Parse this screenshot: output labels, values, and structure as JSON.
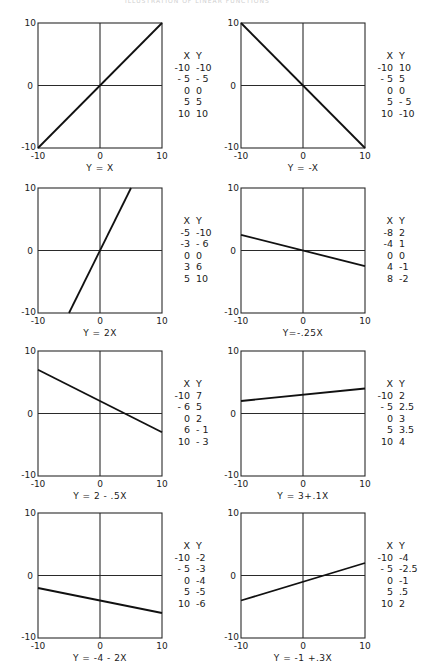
{
  "page": {
    "header_left": "",
    "header_center": "ILLUSTRATION OF LINEAR FUNCTIONS",
    "header_right": ""
  },
  "axis": {
    "min_label": "-10",
    "zero_label": "0",
    "max_label": "10"
  },
  "table_headers": {
    "x": "X",
    "y": "Y"
  },
  "panels": [
    {
      "equation": "Y = X",
      "rows": [
        [
          "-10",
          "-10"
        ],
        [
          "- 5",
          "- 5"
        ],
        [
          "0",
          "0"
        ],
        [
          "5",
          "5"
        ],
        [
          "10",
          "10"
        ]
      ]
    },
    {
      "equation": "Y = -X",
      "rows": [
        [
          "-10",
          "10"
        ],
        [
          "- 5",
          "5"
        ],
        [
          "0",
          "0"
        ],
        [
          "5",
          "- 5"
        ],
        [
          "10",
          "-10"
        ]
      ]
    },
    {
      "equation": "Y = 2X",
      "rows": [
        [
          "-5",
          "-10"
        ],
        [
          "-3",
          "- 6"
        ],
        [
          "0",
          "0"
        ],
        [
          "3",
          "6"
        ],
        [
          "5",
          "10"
        ]
      ]
    },
    {
      "equation": "Y=-.25X",
      "rows": [
        [
          "-8",
          "2"
        ],
        [
          "-4",
          "1"
        ],
        [
          "0",
          "0"
        ],
        [
          "4",
          "-1"
        ],
        [
          "8",
          "-2"
        ]
      ]
    },
    {
      "equation": "Y = 2 - .5X",
      "rows": [
        [
          "-10",
          "7"
        ],
        [
          "- 6",
          "5"
        ],
        [
          "0",
          "2"
        ],
        [
          "6",
          "- 1"
        ],
        [
          "10",
          "- 3"
        ]
      ]
    },
    {
      "equation": "Y = 3+.1X",
      "rows": [
        [
          "-10",
          "2"
        ],
        [
          "- 5",
          "2.5"
        ],
        [
          "0",
          "3"
        ],
        [
          "5",
          "3.5"
        ],
        [
          "10",
          "4"
        ]
      ]
    },
    {
      "equation": "Y = -4 - 2X",
      "rows": [
        [
          "-10",
          "-2"
        ],
        [
          "- 5",
          "-3"
        ],
        [
          "0",
          "-4"
        ],
        [
          "5",
          "-5"
        ],
        [
          "10",
          "-6"
        ]
      ]
    },
    {
      "equation": "Y = -1 +.3X",
      "rows": [
        [
          "-10",
          "-4"
        ],
        [
          "- 5",
          "-2.5"
        ],
        [
          "0",
          "-1"
        ],
        [
          "5",
          ".5"
        ],
        [
          "10",
          "2"
        ]
      ]
    }
  ],
  "chart_data": [
    {
      "type": "line",
      "title": "Y = X",
      "xlim": [
        -10,
        10
      ],
      "ylim": [
        -10,
        10
      ],
      "grid": false,
      "x": [
        -10,
        -5,
        0,
        5,
        10
      ],
      "series": [
        {
          "name": "Y = X",
          "values": [
            -10,
            -5,
            0,
            5,
            10
          ]
        }
      ],
      "xticks": [
        "-10",
        "0",
        "10"
      ],
      "yticks": [
        "-10",
        "0",
        "10"
      ],
      "legend": "table right"
    },
    {
      "type": "line",
      "title": "Y = -X",
      "xlim": [
        -10,
        10
      ],
      "ylim": [
        -10,
        10
      ],
      "grid": false,
      "x": [
        -10,
        -5,
        0,
        5,
        10
      ],
      "series": [
        {
          "name": "Y = -X",
          "values": [
            10,
            5,
            0,
            -5,
            -10
          ]
        }
      ],
      "xticks": [
        "-10",
        "0",
        "10"
      ],
      "yticks": [
        "-10",
        "0",
        "10"
      ],
      "legend": "table right"
    },
    {
      "type": "line",
      "title": "Y = 2X",
      "xlim": [
        -10,
        10
      ],
      "ylim": [
        -10,
        10
      ],
      "grid": false,
      "x": [
        -5,
        -3,
        0,
        3,
        5
      ],
      "series": [
        {
          "name": "Y = 2X",
          "values": [
            -10,
            -6,
            0,
            6,
            10
          ]
        }
      ],
      "xticks": [
        "-10",
        "0",
        "10"
      ],
      "yticks": [
        "-10",
        "0",
        "10"
      ],
      "legend": "table right"
    },
    {
      "type": "line",
      "title": "Y=-.25X",
      "xlim": [
        -10,
        10
      ],
      "ylim": [
        -10,
        10
      ],
      "grid": false,
      "x": [
        -8,
        -4,
        0,
        4,
        8
      ],
      "series": [
        {
          "name": "Y=-.25X",
          "values": [
            2,
            1,
            0,
            -1,
            -2
          ]
        }
      ],
      "xticks": [
        "-10",
        "0",
        "10"
      ],
      "yticks": [
        "-10",
        "0",
        "10"
      ],
      "legend": "table right"
    },
    {
      "type": "line",
      "title": "Y = 2 - .5X",
      "xlim": [
        -10,
        10
      ],
      "ylim": [
        -10,
        10
      ],
      "grid": false,
      "x": [
        -10,
        -6,
        0,
        6,
        10
      ],
      "series": [
        {
          "name": "Y = 2 - .5X",
          "values": [
            7,
            5,
            2,
            -1,
            -3
          ]
        }
      ],
      "xticks": [
        "-10",
        "0",
        "10"
      ],
      "yticks": [
        "-10",
        "0",
        "10"
      ],
      "legend": "table right"
    },
    {
      "type": "line",
      "title": "Y = 3+.1X",
      "xlim": [
        -10,
        10
      ],
      "ylim": [
        -10,
        10
      ],
      "grid": false,
      "x": [
        -10,
        -5,
        0,
        5,
        10
      ],
      "series": [
        {
          "name": "Y = 3+.1X",
          "values": [
            2,
            2.5,
            3,
            3.5,
            4
          ]
        }
      ],
      "xticks": [
        "-10",
        "0",
        "10"
      ],
      "yticks": [
        "-10",
        "0",
        "10"
      ],
      "legend": "table right"
    },
    {
      "type": "line",
      "title": "Y = -4 - 2X",
      "xlim": [
        -10,
        10
      ],
      "ylim": [
        -10,
        10
      ],
      "grid": false,
      "x": [
        -10,
        -5,
        0,
        5,
        10
      ],
      "series": [
        {
          "name": "Y = -4 - 2X",
          "values": [
            -2,
            -3,
            -4,
            -5,
            -6
          ]
        }
      ],
      "xticks": [
        "-10",
        "0",
        "10"
      ],
      "yticks": [
        "-10",
        "0",
        "10"
      ],
      "legend": "table right"
    },
    {
      "type": "line",
      "title": "Y = -1 +.3X",
      "xlim": [
        -10,
        10
      ],
      "ylim": [
        -10,
        10
      ],
      "grid": false,
      "x": [
        -10,
        -5,
        0,
        5,
        10
      ],
      "series": [
        {
          "name": "Y = -1 +.3X",
          "values": [
            -4,
            -2.5,
            -1,
            0.5,
            2
          ]
        }
      ],
      "xticks": [
        "-10",
        "0",
        "10"
      ],
      "yticks": [
        "-10",
        "0",
        "10"
      ],
      "legend": "table right"
    }
  ]
}
